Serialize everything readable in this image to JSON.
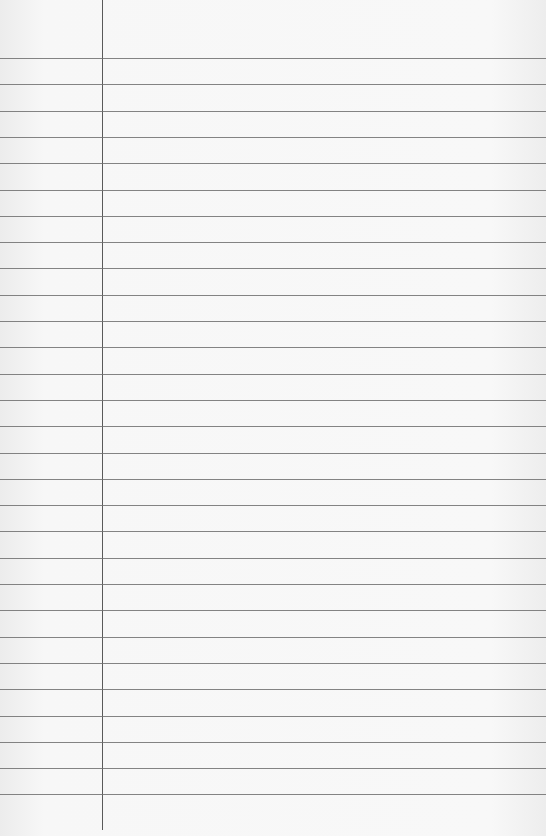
{
  "paper": {
    "type": "lined-notebook-paper",
    "background_color": "#f6f6f6",
    "rule_color": "#6f6f6f",
    "margin_line_color": "#5a5a5a",
    "margin_x": 102,
    "first_rule_y": 58,
    "rule_spacing": 26.3,
    "rule_count": 29
  }
}
